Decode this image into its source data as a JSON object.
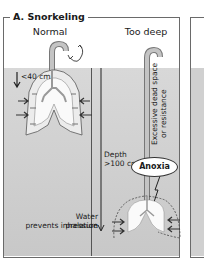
{
  "panel": {
    "title": "A. Snorkeling",
    "columns": [
      {
        "label": "Normal"
      },
      {
        "label": "Too deep"
      }
    ]
  },
  "annotations": {
    "shallow_depth": "<40 cm",
    "deep_depth_line1": "Depth",
    "deep_depth_line2": ">100 cm",
    "dead_space_line1": "Excessive dead space",
    "dead_space_line2": "or resistance",
    "anoxia": "Anoxia",
    "pressure_line1": "Water pressure",
    "pressure_line2": "prevents inhalation"
  },
  "colors": {
    "water": "#d0d0d0",
    "lung": "#f4f4f4",
    "snorkel": "#b5b5b5",
    "outline": "#555555"
  }
}
